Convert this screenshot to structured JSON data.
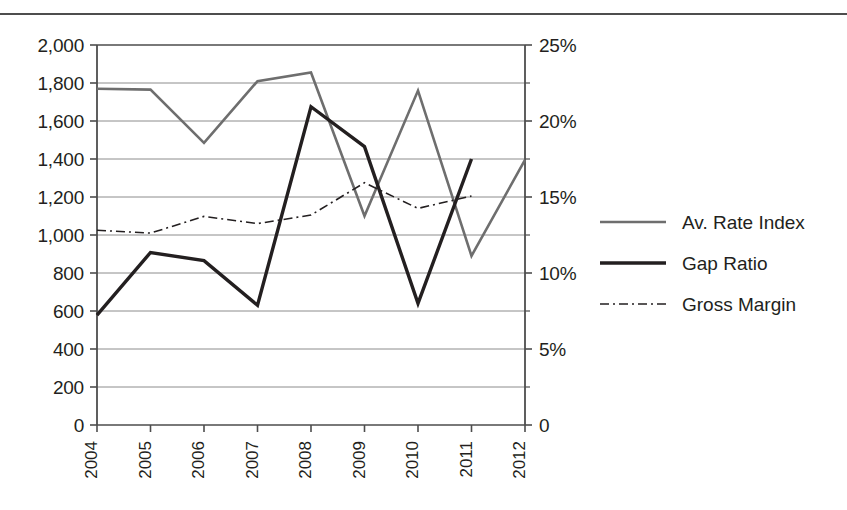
{
  "chart_data": {
    "type": "line",
    "title": "",
    "subtitle": "",
    "xlabel": "",
    "ylabel": "",
    "y2label": "",
    "categories": [
      "2004",
      "2005",
      "2006",
      "2007",
      "2008",
      "2009",
      "2010",
      "2011",
      "2012"
    ],
    "axes": {
      "left": {
        "min": 0,
        "max": 2000,
        "step": 200,
        "ticks": [
          0,
          200,
          400,
          600,
          800,
          1000,
          1200,
          1400,
          1600,
          1800,
          2000
        ],
        "tick_labels": [
          "0",
          "200",
          "400",
          "600",
          "800",
          "1,000",
          "1,200",
          "1,400",
          "1,600",
          "1,800",
          "2,000"
        ]
      },
      "right": {
        "min": 0,
        "max": 25,
        "step": 5,
        "ticks": [
          0,
          5,
          10,
          15,
          20,
          25
        ],
        "tick_labels": [
          "0",
          "5%",
          "10%",
          "15%",
          "20%",
          "25%"
        ]
      },
      "grid": "horizontal",
      "x_tick_label_rotation": -90
    },
    "series": [
      {
        "name": "Av. Rate Index",
        "axis": "left",
        "style": "solid",
        "color": "#6e6e6e",
        "width": 2.6,
        "values": [
          1770,
          1765,
          1485,
          1810,
          1855,
          1100,
          1760,
          890,
          1395
        ]
      },
      {
        "name": "Gap Ratio",
        "axis": "left",
        "style": "solid",
        "color": "#231f20",
        "width": 3.4,
        "values": [
          578,
          908,
          865,
          630,
          1675,
          1465,
          640,
          1400,
          null
        ]
      },
      {
        "name": "Gross Margin",
        "axis": "left",
        "style": "dashdot",
        "color": "#231f20",
        "width": 1.6,
        "values": [
          1025,
          1010,
          1098,
          1060,
          1105,
          1275,
          1140,
          1205,
          null
        ]
      }
    ],
    "legend": {
      "position": "right",
      "entries": [
        {
          "label": "Av. Rate Index",
          "style": "solid",
          "color": "#6e6e6e",
          "width": 2.6
        },
        {
          "label": "Gap Ratio",
          "style": "solid",
          "color": "#231f20",
          "width": 3.4
        },
        {
          "label": "Gross Margin",
          "style": "dashdot",
          "color": "#231f20",
          "width": 1.6
        }
      ]
    }
  },
  "colors": {
    "axis": "#4d4d4d",
    "grid": "#8c8c8c",
    "text": "#231f20",
    "series_gray": "#6e6e6e",
    "series_black": "#231f20",
    "rule": "#4d4d4d"
  }
}
